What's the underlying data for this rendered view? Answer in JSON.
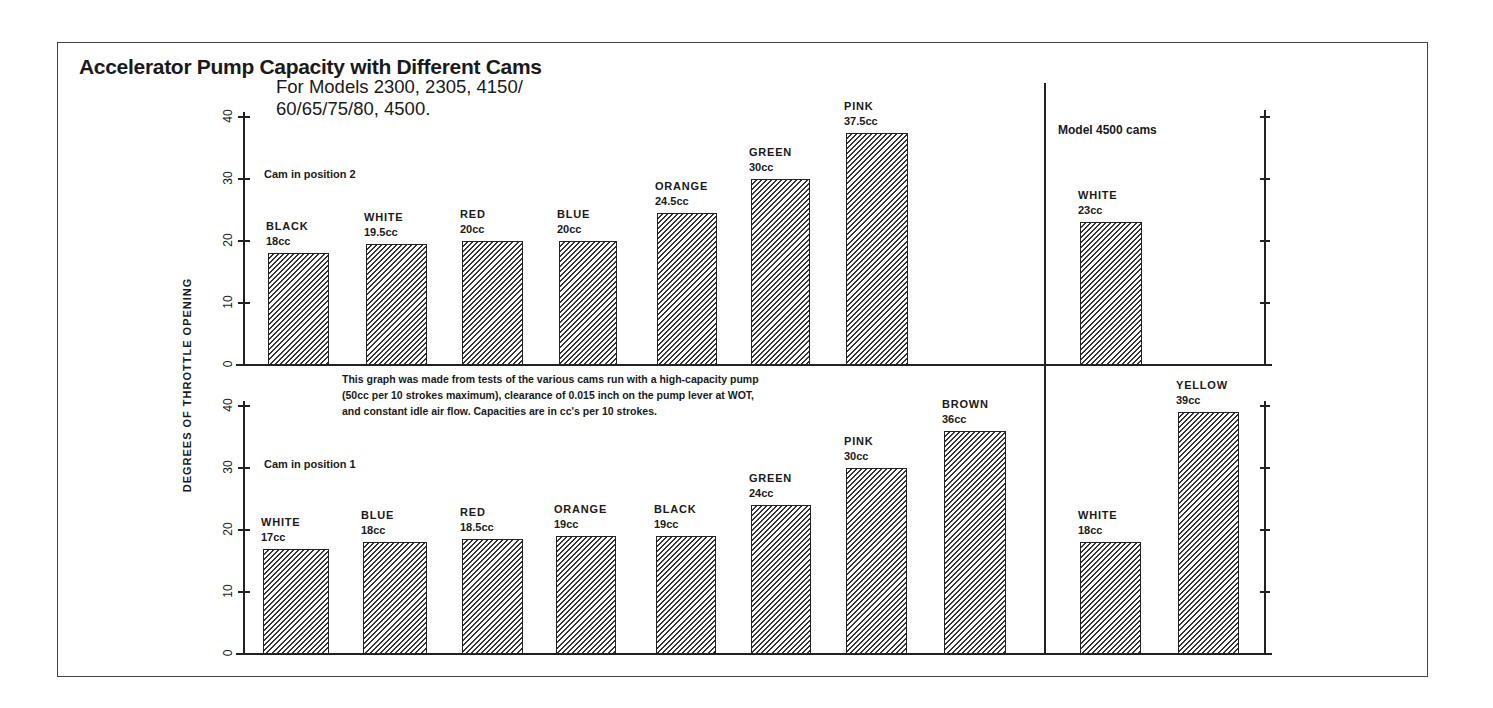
{
  "title": "Accelerator Pump Capacity with Different Cams",
  "subtitle": "For Models 2300, 2305, 4150/\n60/65/75/80, 4500.",
  "ylabel": "DEGREES OF THROTTLE OPENING",
  "note": "This graph was made from tests of the various cams run with a high-capacity pump\n(50cc per 10 strokes maximum), clearance of 0.015 inch on the pump lever at WOT,\nand constant idle air flow. Capacities are in cc's per 10 strokes.",
  "model_note": "Model 4500 cams",
  "ticks": [
    "0",
    "10",
    "20",
    "30",
    "40"
  ],
  "panels": {
    "top": {
      "label": "Cam in position 2"
    },
    "bottom": {
      "label": "Cam in position 1"
    }
  },
  "chart_data": [
    {
      "type": "bar",
      "title": "Cam in position 2",
      "ylabel": "DEGREES OF THROTTLE OPENING",
      "ylim": [
        0,
        40
      ],
      "categories": [
        "BLACK",
        "WHITE",
        "RED",
        "BLUE",
        "ORANGE",
        "GREEN",
        "PINK"
      ],
      "values": [
        18,
        19.5,
        20,
        20,
        24.5,
        30,
        37.5
      ],
      "labels": [
        "18cc",
        "19.5cc",
        "20cc",
        "20cc",
        "24.5cc",
        "30cc",
        "37.5cc"
      ]
    },
    {
      "type": "bar",
      "title": "Cam in position 1",
      "ylabel": "DEGREES OF THROTTLE OPENING",
      "ylim": [
        0,
        40
      ],
      "categories": [
        "WHITE",
        "BLUE",
        "RED",
        "ORANGE",
        "BLACK",
        "GREEN",
        "PINK",
        "BROWN"
      ],
      "values": [
        17,
        18,
        18.5,
        19,
        19,
        24,
        30,
        36
      ],
      "labels": [
        "17cc",
        "18cc",
        "18.5cc",
        "19cc",
        "19cc",
        "24cc",
        "30cc",
        "36cc"
      ]
    },
    {
      "type": "bar",
      "title": "Model 4500 cams - Cam in position 2",
      "ylim": [
        0,
        40
      ],
      "categories": [
        "WHITE"
      ],
      "values": [
        23
      ],
      "labels": [
        "23cc"
      ]
    },
    {
      "type": "bar",
      "title": "Model 4500 cams - Cam in position 1",
      "ylim": [
        0,
        40
      ],
      "categories": [
        "WHITE",
        "YELLOW"
      ],
      "values": [
        18,
        39
      ],
      "labels": [
        "18cc",
        "39cc"
      ]
    }
  ],
  "bars": {
    "top": [
      {
        "name": "BLACK",
        "val": "18cc",
        "x": 268,
        "w": 61,
        "v": 18
      },
      {
        "name": "WHITE",
        "val": "19.5cc",
        "x": 366,
        "w": 61,
        "v": 19.5
      },
      {
        "name": "RED",
        "val": "20cc",
        "x": 462,
        "w": 61,
        "v": 20
      },
      {
        "name": "BLUE",
        "val": "20cc",
        "x": 559,
        "w": 58,
        "v": 20
      },
      {
        "name": "ORANGE",
        "val": "24.5cc",
        "x": 657,
        "w": 60,
        "v": 24.5
      },
      {
        "name": "GREEN",
        "val": "30cc",
        "x": 751,
        "w": 59,
        "v": 30
      },
      {
        "name": "PINK",
        "val": "37.5cc",
        "x": 846,
        "w": 62,
        "v": 37.5
      },
      {
        "name": "WHITE",
        "val": "23cc",
        "x": 1080,
        "w": 62,
        "v": 23
      }
    ],
    "bottom": [
      {
        "name": "WHITE",
        "val": "17cc",
        "x": 263,
        "w": 66,
        "v": 17
      },
      {
        "name": "BLUE",
        "val": "18cc",
        "x": 363,
        "w": 64,
        "v": 18
      },
      {
        "name": "RED",
        "val": "18.5cc",
        "x": 462,
        "w": 61,
        "v": 18.5
      },
      {
        "name": "ORANGE",
        "val": "19cc",
        "x": 556,
        "w": 60,
        "v": 19
      },
      {
        "name": "BLACK",
        "val": "19cc",
        "x": 656,
        "w": 60,
        "v": 19
      },
      {
        "name": "GREEN",
        "val": "24cc",
        "x": 751,
        "w": 60,
        "v": 24
      },
      {
        "name": "PINK",
        "val": "30cc",
        "x": 846,
        "w": 61,
        "v": 30
      },
      {
        "name": "BROWN",
        "val": "36cc",
        "x": 944,
        "w": 62,
        "v": 36
      },
      {
        "name": "WHITE",
        "val": "18cc",
        "x": 1080,
        "w": 61,
        "v": 18
      },
      {
        "name": "YELLOW",
        "val": "39cc",
        "x": 1178,
        "w": 61,
        "v": 39
      }
    ]
  }
}
